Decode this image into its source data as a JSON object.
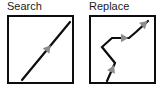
{
  "figure": {
    "type": "diagram",
    "background_color": "#ffffff"
  },
  "panels": [
    {
      "id": "search",
      "label": "Search",
      "box": {
        "border_color": "#0d0d0d",
        "border_width_px": 2,
        "fill": "#ffffff"
      },
      "graph": {
        "stroke_color": "#0d0d0d",
        "stroke_width_px": 2,
        "arrow_fill": "#8c8c8c",
        "arrow_count": 1,
        "path_kind": "straight-diagonal",
        "points": [
          {
            "x": 13,
            "y": 63
          },
          {
            "x": 61,
            "y": 5
          }
        ],
        "arrows": [
          {
            "x": 37,
            "y": 34,
            "angle_deg": -50
          }
        ]
      }
    },
    {
      "id": "replace",
      "label": "Replace",
      "box": {
        "border_color": "#0d0d0d",
        "border_width_px": 2,
        "fill": "#ffffff"
      },
      "graph": {
        "stroke_color": "#0d0d0d",
        "stroke_width_px": 2,
        "arrow_fill": "#8c8c8c",
        "arrow_count": 3,
        "path_kind": "zigzag-polyline",
        "points": [
          {
            "x": 16,
            "y": 64
          },
          {
            "x": 24,
            "y": 46
          },
          {
            "x": 11,
            "y": 30
          },
          {
            "x": 21,
            "y": 21
          },
          {
            "x": 38,
            "y": 21
          },
          {
            "x": 45,
            "y": 15
          },
          {
            "x": 57,
            "y": 4
          }
        ],
        "arrows": [
          {
            "x": 20,
            "y": 55,
            "angle_deg": -66
          },
          {
            "x": 30,
            "y": 21,
            "angle_deg": 0
          },
          {
            "x": 51,
            "y": 9,
            "angle_deg": -43
          }
        ]
      }
    }
  ],
  "colors": {
    "ink": "#0d0d0d",
    "arrow_gray": "#8c8c8c",
    "label_text": "#1b1b1b",
    "paper": "#ffffff"
  }
}
